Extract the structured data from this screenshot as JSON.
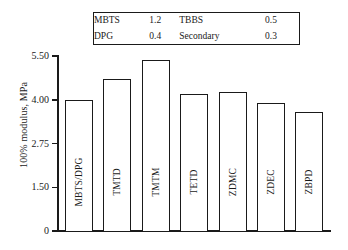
{
  "chart_data": {
    "type": "bar",
    "title": "",
    "xlabel": "",
    "ylabel": "100% modulus, MPa",
    "categories": [
      "MBTS/DPG",
      "TMTD",
      "TMTM",
      "TETD",
      "ZDMC",
      "ZDEC",
      "ZBPD"
    ],
    "values": [
      4.0,
      4.7,
      5.35,
      4.2,
      4.25,
      3.9,
      3.65
    ],
    "ytick_labels": [
      "5.50",
      "4.00",
      "2.75",
      "1.50",
      "0"
    ],
    "ytick_values": [
      5.5,
      4.0,
      2.75,
      1.5,
      0
    ],
    "ylim": [
      0,
      5.5
    ],
    "grid": false,
    "legend_position": "top-center",
    "bar_fill": "#ffffff",
    "bar_edge": "#1a1a1a",
    "series": [
      {
        "name": "100% modulus",
        "values": [
          4.0,
          4.7,
          5.35,
          4.2,
          4.25,
          3.9,
          3.65
        ]
      }
    ],
    "annotations": [
      {
        "name": "MBTS",
        "value": "1.2"
      },
      {
        "name": "DPG",
        "value": "0.4"
      },
      {
        "name": "TBBS",
        "value": "0.5"
      },
      {
        "name": "Secondary",
        "value": "0.3"
      }
    ]
  },
  "legend_box": {
    "rows": [
      {
        "name_left": "MBTS",
        "value_left": "1.2",
        "name_right": "TBBS",
        "value_right": "0.5"
      },
      {
        "name_left": "DPG",
        "value_left": "0.4",
        "name_right": "Secondary",
        "value_right": "0.3"
      }
    ]
  },
  "axis": {
    "y_title": "100% modulus, MPa",
    "ticks": [
      {
        "label": "5.50",
        "value": 5.5
      },
      {
        "label": "4.00",
        "value": 4.0
      },
      {
        "label": "2.75",
        "value": 2.75
      },
      {
        "label": "1.50",
        "value": 1.5
      },
      {
        "label": "0",
        "value": 0
      }
    ]
  },
  "bars": [
    {
      "label": "MBTS/DPG",
      "value": 4.0
    },
    {
      "label": "TMTD",
      "value": 4.7
    },
    {
      "label": "TMTM",
      "value": 5.35
    },
    {
      "label": "TETD",
      "value": 4.2
    },
    {
      "label": "ZDMC",
      "value": 4.25
    },
    {
      "label": "ZDEC",
      "value": 3.9
    },
    {
      "label": "ZBPD",
      "value": 3.65
    }
  ]
}
